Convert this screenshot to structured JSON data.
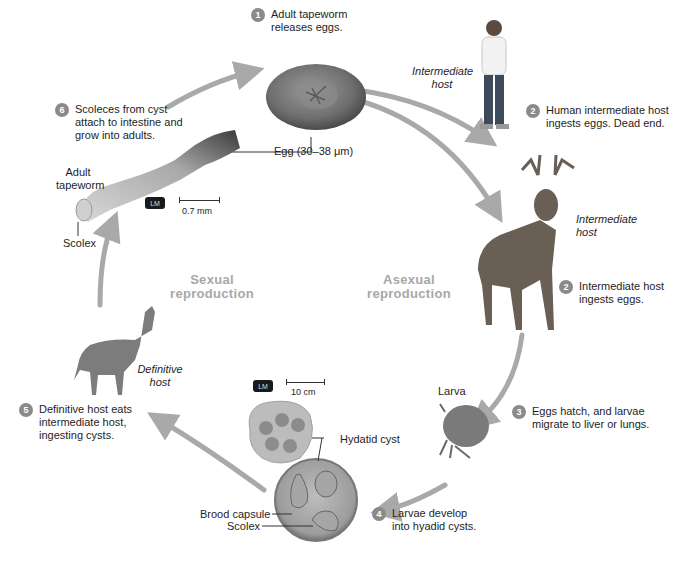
{
  "diagram": {
    "center_labels": {
      "sexual": [
        "Sexual",
        "reproduction"
      ],
      "asexual": [
        "Asexual",
        "reproduction"
      ]
    },
    "steps": [
      {
        "num": "1",
        "lines": [
          "Adult tapeworm",
          "releases eggs."
        ]
      },
      {
        "num": "2",
        "lines": [
          "Human intermediate host",
          "ingests eggs. Dead end."
        ]
      },
      {
        "num": "2",
        "lines": [
          "Intermediate host",
          "ingests eggs."
        ]
      },
      {
        "num": "3",
        "lines": [
          "Eggs hatch, and larvae",
          "migrate to liver or lungs."
        ]
      },
      {
        "num": "4",
        "lines": [
          "Larvae develop",
          "into hyadid cysts."
        ]
      },
      {
        "num": "5",
        "lines": [
          "Definitive host eats",
          "intermediate host,",
          "ingesting cysts."
        ]
      },
      {
        "num": "6",
        "lines": [
          "Scoleces from cyst",
          "attach to intestine and",
          "grow into adults."
        ]
      }
    ],
    "host_labels": {
      "human": [
        "Intermediate",
        "host"
      ],
      "deer": [
        "Intermediate",
        "host"
      ],
      "wolf": [
        "Definitive",
        "host"
      ]
    },
    "callouts": {
      "egg": "Egg (30–38 μm)",
      "adult_tapeworm": [
        "Adult",
        "tapeworm"
      ],
      "scolex_top": "Scolex",
      "larva": "Larva",
      "hydatid_cyst": "Hydatid cyst",
      "brood_capsule": "Brood capsule",
      "scolex_bottom": "Scolex"
    },
    "scales": {
      "tapeworm": {
        "badge": "LM",
        "length": "0.7 mm"
      },
      "cyst": {
        "badge": "LM",
        "length": "10 cm"
      }
    },
    "colors": {
      "arrow": "#a9a9a9",
      "step_badge": "#8a8a8a",
      "center_label": "#a8a8a8",
      "text": "#1e1e1e"
    }
  }
}
